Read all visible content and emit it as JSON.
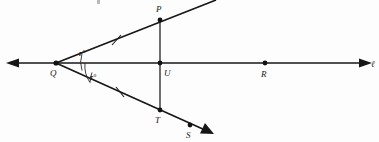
{
  "figure": {
    "kind": "geometry-diagram",
    "background_color": "#fdfdfd",
    "ink_color": "#161616"
  },
  "points": [
    {
      "id": "Q",
      "label": "Q",
      "x": 56,
      "y": 63,
      "label_x": 50,
      "label_y": 76,
      "on": "line-l",
      "is_vertex": true
    },
    {
      "id": "P",
      "label": "P",
      "x": 160,
      "y": 20,
      "label_x": 156,
      "label_y": 12,
      "on": "ray-upper",
      "is_vertex": false
    },
    {
      "id": "U",
      "label": "U",
      "x": 160,
      "y": 63,
      "label_x": 164,
      "label_y": 76,
      "on": "line-l",
      "is_vertex": false
    },
    {
      "id": "R",
      "label": "R",
      "x": 265,
      "y": 63,
      "label_x": 261,
      "label_y": 77,
      "on": "line-l",
      "is_vertex": false
    },
    {
      "id": "T",
      "label": "T",
      "x": 160,
      "y": 110,
      "label_x": 155,
      "label_y": 123,
      "on": "ray-lower",
      "is_vertex": false
    },
    {
      "id": "S",
      "label": "S",
      "x": 190,
      "y": 125,
      "label_x": 186,
      "label_y": 138,
      "on": "ray-lower",
      "is_vertex": false
    }
  ],
  "lines": [
    {
      "id": "line-l",
      "label": "ℓ",
      "label_x": 372,
      "label_y": 66,
      "type": "double-arrow-line",
      "x1": 8,
      "y1": 63,
      "x2": 370,
      "y2": 63
    },
    {
      "id": "ray-upper",
      "label": "",
      "type": "ray",
      "x1": 56,
      "y1": 63,
      "x2": 216,
      "y2": 0
    },
    {
      "id": "ray-lower",
      "label": "",
      "type": "ray-arrow",
      "x1": 56,
      "y1": 63,
      "x2": 212,
      "y2": 133
    },
    {
      "id": "segment-PT",
      "label": "",
      "type": "segment",
      "x1": 160,
      "y1": 20,
      "x2": 160,
      "y2": 110
    }
  ],
  "angles": [
    {
      "id": "angle-PQU",
      "label": "r°",
      "label_x": 79,
      "label_y": 55,
      "arc_radius": 26,
      "at": "Q"
    },
    {
      "id": "angle-UQT",
      "label": "r°",
      "label_x": 90,
      "label_y": 79,
      "arc_radius": 30,
      "at": "Q"
    }
  ],
  "tick_marks": [
    {
      "id": "tick-QP",
      "on": "ray-upper",
      "x": 116,
      "y": 40
    },
    {
      "id": "tick-QT",
      "on": "ray-lower",
      "x": 120,
      "y": 92
    }
  ],
  "labels_summary": {
    "point_labels": [
      "Q",
      "P",
      "U",
      "R",
      "T",
      "S"
    ],
    "angle_labels": [
      "r°",
      "r°"
    ],
    "line_labels": [
      "ℓ"
    ]
  }
}
